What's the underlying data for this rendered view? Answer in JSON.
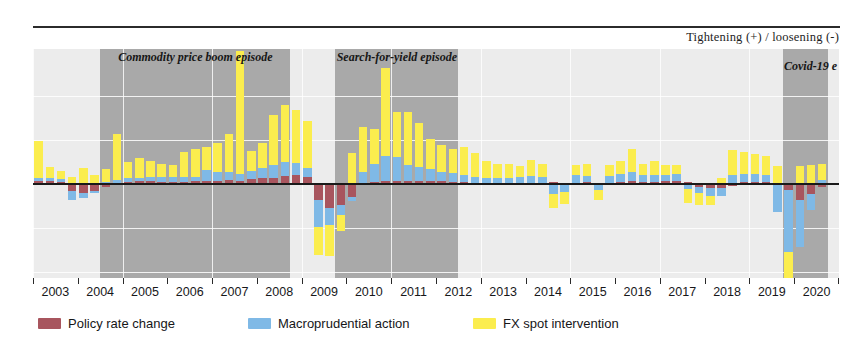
{
  "header": {
    "axis_note": "Tightening (+) / loosening (-)"
  },
  "legend": {
    "items": [
      {
        "label": "Policy rate change",
        "color": "#a8555e",
        "key": "policy"
      },
      {
        "label": "Macroprudential action",
        "color": "#7fb9e6",
        "key": "macroprudential"
      },
      {
        "label": "FX spot intervention",
        "color": "#fbed4e",
        "key": "fx"
      }
    ]
  },
  "chart_data": {
    "type": "bar",
    "stacked": true,
    "title": "",
    "subtitle": "",
    "xlabel": "",
    "ylabel": "Tightening (+) / loosening (-)",
    "grid": true,
    "legend_position": "bottom",
    "ylim": [
      -3.2,
      4.6
    ],
    "x_tick_labels": [
      "2003",
      "2004",
      "2005",
      "2006",
      "2007",
      "2008",
      "2009",
      "2010",
      "2011",
      "2012",
      "2013",
      "2014",
      "2015",
      "2016",
      "2017",
      "2018",
      "2019",
      "2020"
    ],
    "x_frequency": "quarterly",
    "episodes": [
      {
        "label": "Commodity price boom episode",
        "start": "2004Q3",
        "end": "2008Q3",
        "color": "#a9a9a9"
      },
      {
        "label": "Search-for-yield episode",
        "start": "2009Q4",
        "end": "2012Q2",
        "color": "#a9a9a9"
      },
      {
        "label": "Covid-19 e",
        "start": "2019Q4",
        "end": "2020Q3",
        "color": "#a9a9a9"
      }
    ],
    "series": [
      {
        "name": "Policy rate change",
        "color": "#a8555e",
        "values": [
          0.1,
          0.12,
          0.08,
          -0.25,
          -0.3,
          -0.22,
          -0.1,
          0.05,
          0.06,
          0.1,
          0.12,
          0.08,
          0.06,
          0.08,
          0.1,
          0.12,
          0.1,
          0.14,
          0.12,
          0.18,
          0.22,
          0.2,
          0.26,
          0.3,
          0.24,
          -0.55,
          -0.8,
          -0.7,
          -0.45,
          0.05,
          0.08,
          0.1,
          0.12,
          0.1,
          0.12,
          0.1,
          0.1,
          0.08,
          0.06,
          0.05,
          0.04,
          0.05,
          0.04,
          0.03,
          0.04,
          0.05,
          0.06,
          0.04,
          0.05,
          0.06,
          0.05,
          0.04,
          0.08,
          0.1,
          0.08,
          0.06,
          0.1,
          0.12,
          0.08,
          -0.1,
          -0.12,
          -0.15,
          -0.08,
          0.06,
          0.08,
          0.06,
          0.05,
          -0.2,
          -0.55,
          -0.35,
          -0.1,
          0.04
        ]
      },
      {
        "name": "Macroprudential action",
        "color": "#7fb9e6",
        "values": [
          0.12,
          0.1,
          0.08,
          -0.3,
          -0.18,
          -0.1,
          0.08,
          0.1,
          0.14,
          0.1,
          0.12,
          0.16,
          0.18,
          0.15,
          0.14,
          0.35,
          0.3,
          0.28,
          0.22,
          0.25,
          0.32,
          0.45,
          0.48,
          0.42,
          0.3,
          -0.9,
          -0.6,
          -0.35,
          -0.12,
          0.35,
          0.6,
          0.85,
          0.8,
          0.55,
          0.45,
          0.4,
          0.32,
          0.28,
          0.25,
          0.2,
          0.18,
          0.15,
          0.18,
          0.2,
          0.22,
          0.18,
          -0.35,
          -0.28,
          0.25,
          0.22,
          -0.2,
          0.24,
          0.26,
          0.3,
          0.22,
          0.26,
          0.2,
          0.22,
          -0.18,
          -0.22,
          -0.3,
          -0.25,
          0.3,
          0.28,
          0.26,
          0.24,
          -0.95,
          -2.1,
          -1.6,
          -0.55,
          0.15
        ]
      },
      {
        "name": "FX spot intervention",
        "color": "#fbed4e",
        "values": [
          1.25,
          0.35,
          0.3,
          0.25,
          0.55,
          0.3,
          0.45,
          1.55,
          0.55,
          0.7,
          0.55,
          0.45,
          0.4,
          0.85,
          0.95,
          0.8,
          1.0,
          1.3,
          4.2,
          0.7,
          0.85,
          1.7,
          1.95,
          1.8,
          1.6,
          -0.95,
          -1.05,
          -0.55,
          1.05,
          1.55,
          1.2,
          3.0,
          1.55,
          1.8,
          1.5,
          1.05,
          0.9,
          0.85,
          0.95,
          0.8,
          0.55,
          0.5,
          0.45,
          0.4,
          0.55,
          0.45,
          -0.45,
          -0.4,
          0.35,
          0.4,
          -0.35,
          0.38,
          0.45,
          0.8,
          0.4,
          0.45,
          0.35,
          0.3,
          -0.45,
          -0.38,
          -0.3,
          0.2,
          0.85,
          0.75,
          0.7,
          0.65,
          0.55,
          -1.5,
          0.6,
          0.65,
          0.55
        ]
      }
    ]
  }
}
